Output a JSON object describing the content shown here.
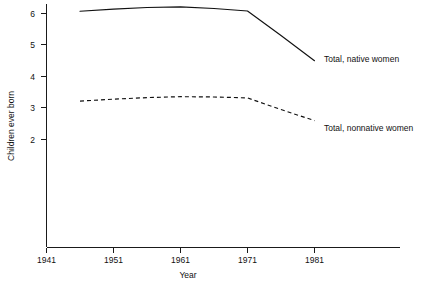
{
  "chart_data": {
    "type": "line",
    "title": "",
    "xlabel": "Year",
    "ylabel": "Children ever born",
    "xlim": [
      1941,
      1986
    ],
    "ylim": [
      1.5,
      6.4
    ],
    "grid": false,
    "legend_position": "inline-right",
    "x_ticks": [
      "1941",
      "1951",
      "1961",
      "1971",
      "1981"
    ],
    "x_tick_values": [
      1941,
      1951,
      1961,
      1971,
      1981
    ],
    "y_ticks": [
      "2",
      "3",
      "4",
      "5",
      "6"
    ],
    "y_tick_values": [
      2,
      3,
      4,
      5,
      6
    ],
    "x": [
      1946,
      1951,
      1956,
      1961,
      1966,
      1971,
      1976,
      1981
    ],
    "series": [
      {
        "name": "Total, native women",
        "style": "solid",
        "color": "#111111",
        "values": [
          6.07,
          6.14,
          6.19,
          6.21,
          6.16,
          6.08,
          5.3,
          4.5
        ]
      },
      {
        "name": "Total, nonnative women",
        "style": "dashed",
        "color": "#111111",
        "values": [
          3.22,
          3.28,
          3.33,
          3.36,
          3.35,
          3.32,
          2.95,
          2.6
        ]
      }
    ],
    "annotations": [
      {
        "text": "Total, native women",
        "series": 0
      },
      {
        "text": "Total, nonnative women",
        "series": 1
      }
    ]
  },
  "axes": {
    "x_label": "Year",
    "y_label": "Children ever born",
    "x_tick_labels": {
      "t0": "1941",
      "t1": "1951",
      "t2": "1961",
      "t3": "1971",
      "t4": "1981"
    },
    "y_tick_labels": {
      "t0": "2",
      "t1": "3",
      "t2": "4",
      "t3": "5",
      "t4": "6"
    }
  },
  "labels": {
    "native": "Total, native women",
    "nonnative": "Total, nonnative women"
  }
}
